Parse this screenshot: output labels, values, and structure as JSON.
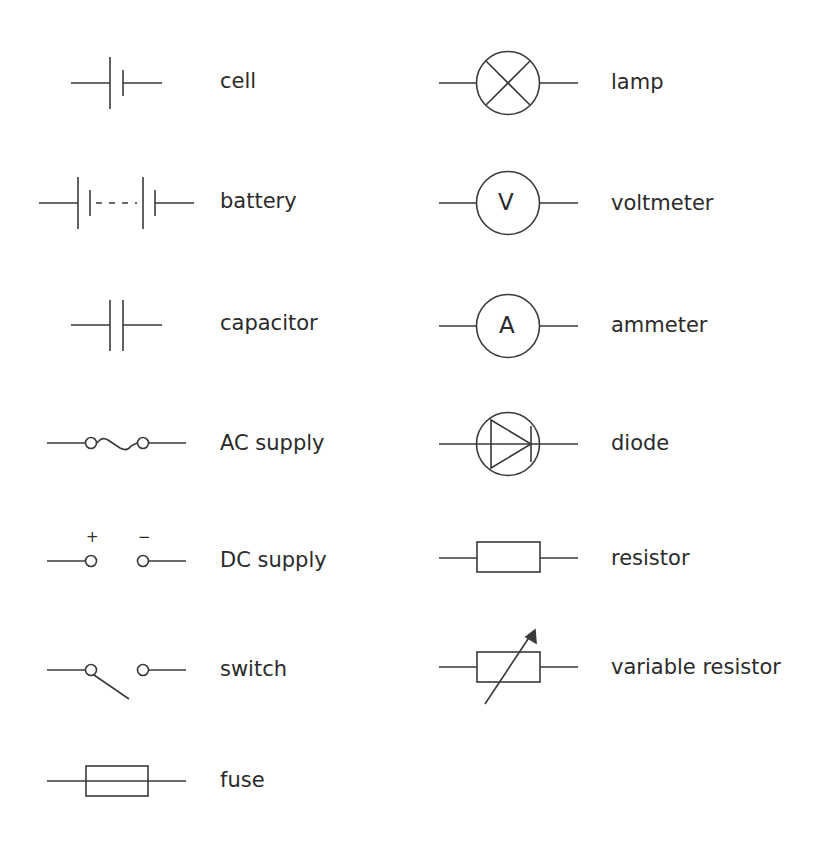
{
  "colors": {
    "stroke": "#3a3a3a",
    "text": "#2b2b2b",
    "background": "#ffffff"
  },
  "left_column": [
    {
      "id": "cell",
      "label": "cell"
    },
    {
      "id": "battery",
      "label": "battery"
    },
    {
      "id": "capacitor",
      "label": "capacitor"
    },
    {
      "id": "ac-supply",
      "label": "AC supply"
    },
    {
      "id": "dc-supply",
      "label": "DC supply",
      "plus_sign": "+",
      "minus_sign": "−"
    },
    {
      "id": "switch",
      "label": "switch"
    },
    {
      "id": "fuse",
      "label": "fuse"
    }
  ],
  "right_column": [
    {
      "id": "lamp",
      "label": "lamp"
    },
    {
      "id": "voltmeter",
      "label": "voltmeter",
      "glyph": "V"
    },
    {
      "id": "ammeter",
      "label": "ammeter",
      "glyph": "A"
    },
    {
      "id": "diode",
      "label": "diode"
    },
    {
      "id": "resistor",
      "label": "resistor"
    },
    {
      "id": "variable-resistor",
      "label": "variable resistor"
    }
  ]
}
